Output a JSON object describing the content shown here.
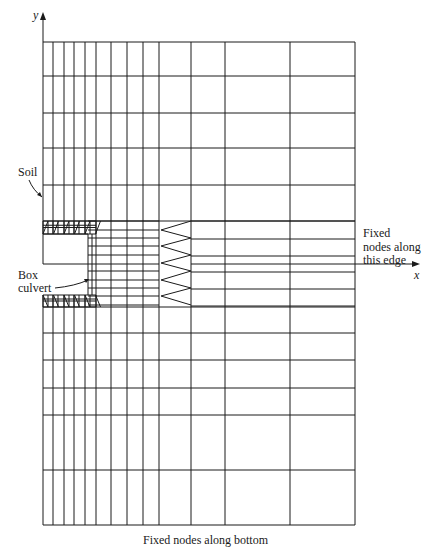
{
  "labels": {
    "y_axis": "y",
    "x_axis": "x",
    "soil": "Soil",
    "box_culvert_line1": "Box",
    "box_culvert_line2": "culvert",
    "fixed_edge_line1": "Fixed",
    "fixed_edge_line2": "nodes along",
    "fixed_edge_line3": "this edge",
    "fixed_bottom": "Fixed nodes along bottom"
  },
  "colors": {
    "line": "#1a1a1a",
    "background": "#ffffff"
  },
  "mesh": {
    "left": 43,
    "right": 355,
    "top": 42,
    "bottom": 525,
    "x_axis_y": 264,
    "x_axis_end": 420,
    "y_axis_top": 12,
    "vertical_lines": [
      43,
      53,
      64,
      74,
      85,
      96,
      111,
      127,
      143,
      159,
      191,
      225,
      290,
      355
    ],
    "coarse_vertical_lines": [
      191,
      225,
      290,
      355
    ],
    "upper_horizontal_lines": [
      42,
      76,
      113,
      148,
      185,
      221
    ],
    "lower_horizontal_lines": [
      307,
      333,
      360,
      388,
      415,
      470,
      525
    ],
    "fine_horizontal_lines": [
      221,
      230,
      238,
      246,
      255,
      264,
      271,
      280,
      288,
      296,
      305
    ],
    "coarse_horizontal_lines": [
      221,
      239,
      256,
      264,
      272,
      289,
      306
    ],
    "zigzag_points": [
      [
        191,
        221
      ],
      [
        161,
        230
      ],
      [
        191,
        238
      ],
      [
        161,
        246
      ],
      [
        191,
        255
      ],
      [
        161,
        263
      ],
      [
        191,
        271
      ],
      [
        161,
        280
      ],
      [
        191,
        288
      ],
      [
        161,
        296
      ],
      [
        191,
        305
      ]
    ],
    "culvert": {
      "top_slab": {
        "y1": 221,
        "y2": 234
      },
      "bottom_slab": {
        "y1": 295,
        "y2": 307
      },
      "wall": {
        "x1": 88,
        "x2": 96
      },
      "void_left": 44,
      "void_bottom": 264
    }
  }
}
